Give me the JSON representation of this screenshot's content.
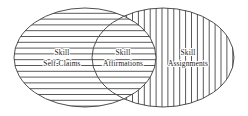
{
  "diagram": {
    "type": "venn",
    "title": "",
    "background_color": "#ffffff",
    "stroke_color": "#3c3c3c",
    "text_color": "#1a1a1a",
    "sets": [
      {
        "id": "self-claims",
        "label_line1": "Skill",
        "label_line2": "Self-Claims",
        "fill_pattern": "horizontal-lines",
        "region": "left"
      },
      {
        "id": "assignments",
        "label_line1": "Skill",
        "label_line2": "Assignments",
        "fill_pattern": "vertical-lines",
        "region": "right"
      }
    ],
    "intersection": {
      "id": "affirmations",
      "label_line1": "Skill",
      "label_line2": "Affirmations",
      "fill_pattern": "crosshatch",
      "region": "center"
    }
  }
}
